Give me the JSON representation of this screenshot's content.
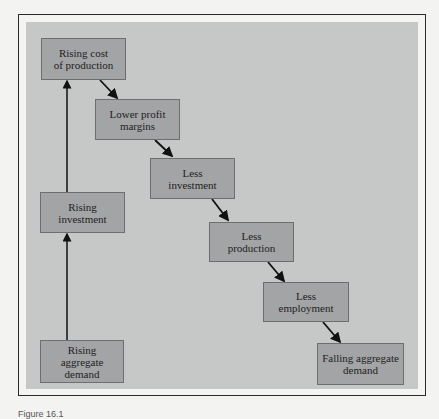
{
  "diagram": {
    "nodes": [
      {
        "id": "rising-cost",
        "label": "Rising cost\nof production"
      },
      {
        "id": "lower-profit",
        "label": "Lower profit\nmargins"
      },
      {
        "id": "less-investment",
        "label": "Less\ninvestment"
      },
      {
        "id": "less-production",
        "label": "Less\nproduction"
      },
      {
        "id": "less-employment",
        "label": "Less\nemployment"
      },
      {
        "id": "falling-demand",
        "label": "Falling aggregate\ndemand"
      },
      {
        "id": "rising-investment",
        "label": "Rising\ninvestment"
      },
      {
        "id": "rising-demand",
        "label": "Rising\naggregate\ndemand"
      }
    ],
    "edges": [
      [
        "rising-demand",
        "rising-investment"
      ],
      [
        "rising-investment",
        "rising-cost"
      ],
      [
        "rising-cost",
        "lower-profit"
      ],
      [
        "lower-profit",
        "less-investment"
      ],
      [
        "less-investment",
        "less-production"
      ],
      [
        "less-production",
        "less-employment"
      ],
      [
        "less-employment",
        "falling-demand"
      ]
    ],
    "caption": "Figure 16.1"
  }
}
